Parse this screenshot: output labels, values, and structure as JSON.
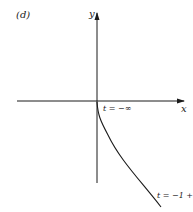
{
  "figure": {
    "panel_label": "(d)",
    "x_axis_label": "x",
    "y_axis_label": "y",
    "annotations": [
      {
        "text": "t = −∞",
        "position": "near origin, curve start"
      },
      {
        "text": "t = −1 +",
        "position": "lower right, curve end"
      }
    ],
    "curve": {
      "description": "curve starting at origin (t = −∞) descending to lower right (t = −1 +)",
      "start": [
        97,
        103
      ],
      "end": [
        161,
        207
      ]
    },
    "colors": {
      "ink": "#1a1a1a",
      "background": "#ffffff"
    }
  }
}
